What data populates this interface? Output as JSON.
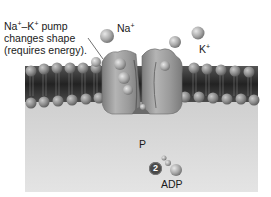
{
  "figure": {
    "callout": {
      "line1_a": "Na",
      "line1_sup1": "+",
      "line1_b": "–K",
      "line1_sup2": "+",
      "line1_c": " pump",
      "line2": "changes shape",
      "line3": "(requires energy)."
    },
    "ions": {
      "sodium": {
        "symbol": "Na",
        "charge": "+"
      },
      "potassium": {
        "symbol": "K",
        "charge": "+"
      }
    },
    "phosphate_label": "P",
    "step_number": "2",
    "adp_label": "ADP",
    "colors": {
      "background": "#ffffff",
      "cytoplasm": "#d4d4d4",
      "membrane_dark": "#2e2e2e",
      "lipid_head": "#8a8a8a",
      "protein": "#9a9a9a",
      "ion": "#b0b0b0",
      "badge": "#4a4a4a"
    }
  }
}
